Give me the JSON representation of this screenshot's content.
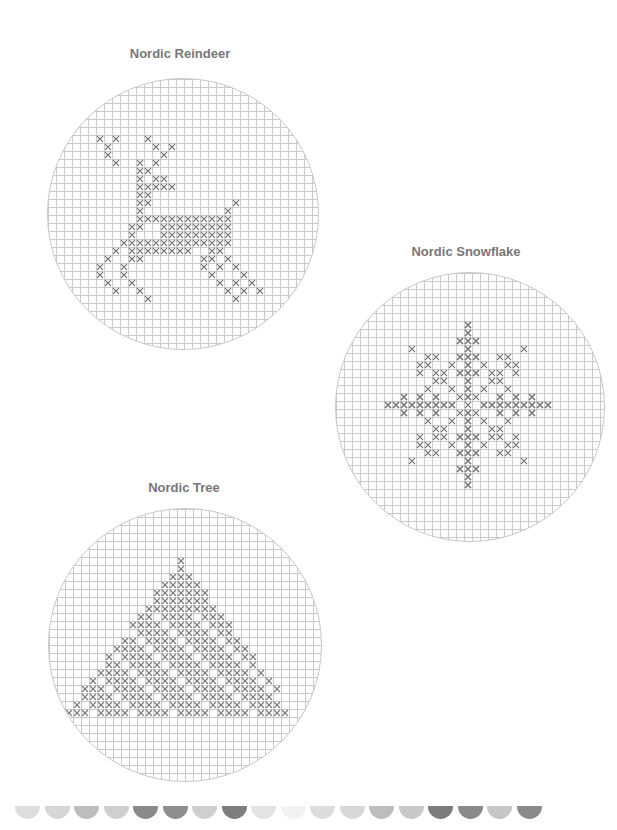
{
  "patterns": [
    {
      "id": "reindeer",
      "title": "Nordic Reindeer"
    },
    {
      "id": "snowflake",
      "title": "Nordic Snowflake"
    },
    {
      "id": "tree",
      "title": "Nordic Tree"
    }
  ],
  "colors": {
    "stitch": "#7a7a7a",
    "grid": "#c9c9c9",
    "title": "#777777"
  },
  "border_scallops": [
    "#dddddd",
    "#d6d6d6",
    "#bdbdbd",
    "#cfcfcf",
    "#8a8a8a",
    "#8e8e8e",
    "#cfcfcf",
    "#7e7e7e",
    "#e3e3e3",
    "#f2f2f2",
    "#dcdcdc",
    "#d8d8d8",
    "#bdbdbd",
    "#c8c8c8",
    "#7c7c7c",
    "#8a8a8a",
    "#c6c6c6",
    "#8a8a8a"
  ]
}
